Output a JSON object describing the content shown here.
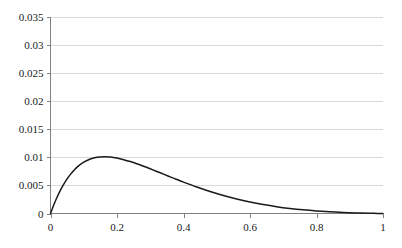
{
  "chart_data": {
    "type": "line",
    "title": "",
    "subtitle": "",
    "xlabel": "",
    "ylabel": "",
    "xlim": [
      0,
      1
    ],
    "ylim": [
      0,
      0.035
    ],
    "grid": "horizontal",
    "legend": "none",
    "x_ticks": [
      "0",
      "0.2",
      "0.4",
      "0.6",
      "0.8",
      "1"
    ],
    "x_tick_values": [
      0,
      0.2,
      0.4,
      0.6,
      0.8,
      1
    ],
    "y_ticks": [
      "0",
      "0.005",
      "0.01",
      "0.015",
      "0.02",
      "0.025",
      "0.03",
      "0.035"
    ],
    "y_tick_values": [
      0,
      0.005,
      0.01,
      0.015,
      0.02,
      0.025,
      0.03,
      0.035
    ],
    "series": [
      {
        "name": "curve",
        "color": "#1a1a1a",
        "x": [
          0,
          0.01,
          0.02,
          0.03,
          0.04,
          0.05,
          0.06,
          0.08,
          0.1,
          0.12,
          0.14,
          0.16,
          0.18,
          0.2,
          0.22,
          0.24,
          0.26,
          0.28,
          0.3,
          0.32,
          0.34,
          0.36,
          0.38,
          0.4,
          0.44,
          0.48,
          0.52,
          0.56,
          0.6,
          0.64,
          0.68,
          0.72,
          0.76,
          0.8,
          0.84,
          0.88,
          0.92,
          0.96,
          0.98,
          1
        ],
        "y": [
          0,
          0.00156,
          0.00294,
          0.00416,
          0.00523,
          0.00616,
          0.00697,
          0.00826,
          0.00914,
          0.00971,
          0.01001,
          0.01011,
          0.01005,
          0.00987,
          0.00959,
          0.00925,
          0.00885,
          0.00842,
          0.00796,
          0.00749,
          0.00701,
          0.00653,
          0.00606,
          0.00559,
          0.00471,
          0.00391,
          0.0032,
          0.00258,
          0.00205,
          0.0016,
          0.00122,
          0.00091,
          0.00066,
          0.00046,
          0.00031,
          0.00019,
          0.0001,
          4e-05,
          2e-05,
          0
        ],
        "peak": {
          "x": 0.32,
          "y": 0.0333
        },
        "endpoints": [
          {
            "x": 0,
            "y": 0
          },
          {
            "x": 1,
            "y": 0
          }
        ]
      }
    ]
  },
  "axes": {
    "y_axis_color": "#808080",
    "x_axis_color": "#808080",
    "gridline_color": "#d9d9d9",
    "background": "#ffffff"
  }
}
